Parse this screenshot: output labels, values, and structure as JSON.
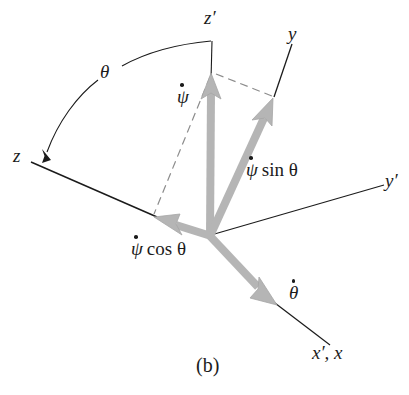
{
  "figure": {
    "caption": "(b)",
    "type": "vector-decomposition-diagram",
    "background_color": "#ffffff",
    "line_color": "#1b1b1b",
    "vector_color": "#b5b5b5",
    "vector_edge_color": "#9a9a9a",
    "dashed_color": "#8c8c8c"
  },
  "axes": [
    {
      "id": "z-prime",
      "label": "z′",
      "label_x": 204,
      "label_y": 10
    },
    {
      "id": "y",
      "label": "y",
      "label_x": 288,
      "label_y": 26
    },
    {
      "id": "z",
      "label": "z",
      "label_x": 14,
      "label_y": 147
    },
    {
      "id": "y-prime",
      "label": "y′",
      "label_x": 385,
      "label_y": 172
    },
    {
      "id": "x-prime-x",
      "label": "x′, x",
      "label_x": 313,
      "label_y": 344
    }
  ],
  "angle": {
    "id": "theta-arc",
    "label": "θ",
    "label_x": 100,
    "label_y": 62
  },
  "vectors": [
    {
      "id": "psi-dot",
      "symbol": "ψ",
      "label_parts": {
        "dotted_symbol": "ψ",
        "suffix": ""
      },
      "label_x": 176,
      "label_y": 86,
      "from": [
        210,
        235
      ],
      "to": [
        212,
        75
      ]
    },
    {
      "id": "psi-dot-sin-theta",
      "symbol": "ψ",
      "label_parts": {
        "dotted_symbol": "ψ",
        "suffix": "sin θ"
      },
      "label_x": 245,
      "label_y": 160,
      "from": [
        210,
        235
      ],
      "to": [
        272,
        100
      ]
    },
    {
      "id": "psi-dot-cos-theta",
      "symbol": "ψ",
      "label_parts": {
        "dotted_symbol": "ψ",
        "suffix": "cos θ"
      },
      "label_x": 131,
      "label_y": 238,
      "from": [
        210,
        235
      ],
      "to": [
        155,
        217
      ]
    },
    {
      "id": "theta-dot",
      "symbol": "θ",
      "label_parts": {
        "dotted_symbol": "θ",
        "suffix": ""
      },
      "label_x": 288,
      "label_y": 282,
      "from": [
        210,
        235
      ],
      "to": [
        275,
        303
      ]
    }
  ],
  "labels": {
    "z_prime": "z′",
    "y": "y",
    "z": "z",
    "y_prime": "y′",
    "x_prime_x": "x′, x",
    "theta": "θ",
    "psi": "ψ",
    "sin_theta": "sin θ",
    "cos_theta": "cos θ",
    "caption": "(b)"
  }
}
